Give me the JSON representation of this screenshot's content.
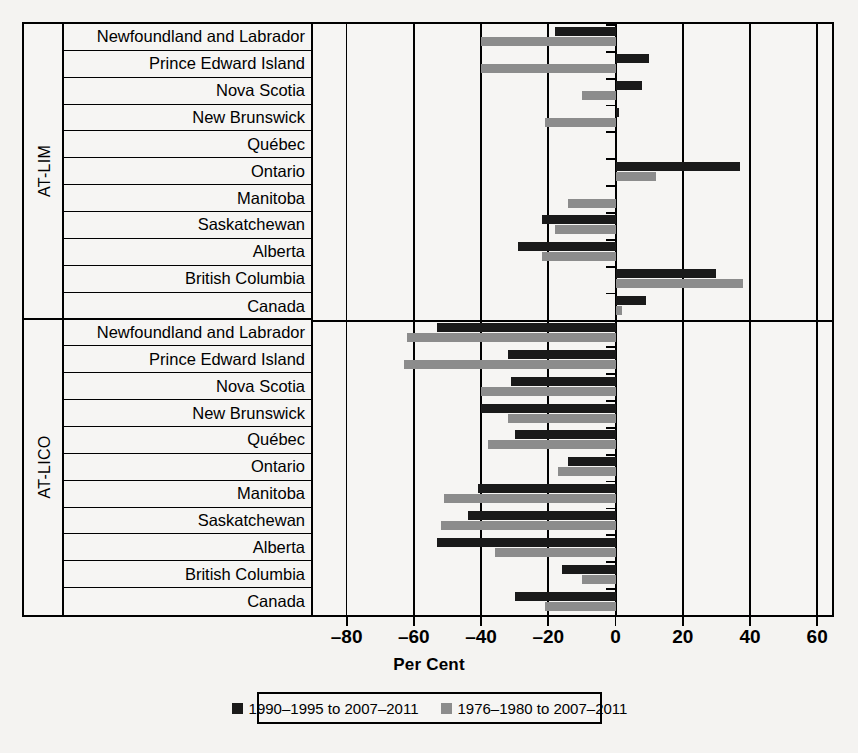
{
  "chart_data": {
    "type": "bar",
    "orientation": "horizontal",
    "title": "",
    "xlabel": "Per Cent",
    "ylabel": "",
    "xlim": [
      -90,
      65
    ],
    "xticks": [
      -80,
      -60,
      -40,
      -20,
      0,
      20,
      40,
      60
    ],
    "xticklabels": [
      "–80",
      "–60",
      "–40",
      "–20",
      "0",
      "20",
      "40",
      "60"
    ],
    "grid": true,
    "gridlines_at": [
      -80,
      -60,
      -40,
      -20,
      0,
      20,
      40,
      60
    ],
    "legend_position": "bottom",
    "series": [
      {
        "name": "1990–1995 to 2007–2011",
        "color": "#1a1a1a"
      },
      {
        "name": "1976–1980 to 2007–2011",
        "color": "#8c8c8c"
      }
    ],
    "groups": [
      {
        "name": "AT-LIM",
        "categories": [
          "Newfoundland and Labrador",
          "Prince Edward Island",
          "Nova Scotia",
          "New Brunswick",
          "Québec",
          "Ontario",
          "Manitoba",
          "Saskatchewan",
          "Alberta",
          "British Columbia",
          "Canada"
        ],
        "values": {
          "1990–1995 to 2007–2011": [
            -18,
            10,
            8,
            1,
            0,
            37,
            0,
            -22,
            -29,
            30,
            9
          ],
          "1976–1980 to 2007–2011": [
            -40,
            -40,
            -10,
            -21,
            0,
            12,
            -14,
            -18,
            -22,
            38,
            2
          ]
        }
      },
      {
        "name": "AT-LICO",
        "categories": [
          "Newfoundland and Labrador",
          "Prince Edward Island",
          "Nova Scotia",
          "New Brunswick",
          "Québec",
          "Ontario",
          "Manitoba",
          "Saskatchewan",
          "Alberta",
          "British Columbia",
          "Canada"
        ],
        "values": {
          "1990–1995 to 2007–2011": [
            -53,
            -32,
            -31,
            -40,
            -30,
            -14,
            -41,
            -44,
            -53,
            -16,
            -30
          ],
          "1976–1980 to 2007–2011": [
            -62,
            -63,
            -40,
            -32,
            -38,
            -17,
            -51,
            -52,
            -36,
            -10,
            -21
          ]
        }
      }
    ]
  },
  "axis": {
    "xlabel": "Per Cent"
  },
  "legend": {
    "items": [
      {
        "label": "1990–1995 to 2007–2011",
        "color": "#1a1a1a"
      },
      {
        "label": "1976–1980 to 2007–2011",
        "color": "#8c8c8c"
      }
    ]
  }
}
